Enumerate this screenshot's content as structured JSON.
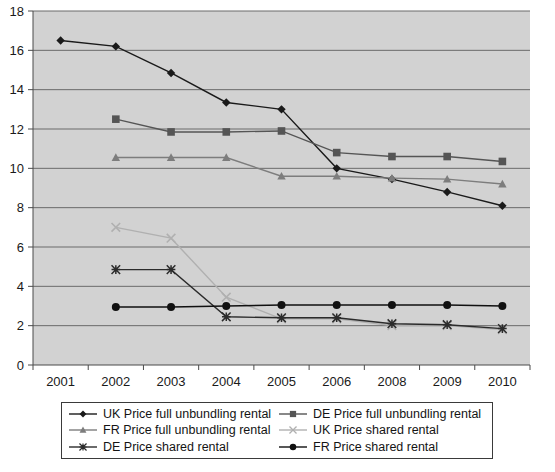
{
  "chart_data": {
    "type": "line",
    "title": "",
    "xlabel": "",
    "ylabel": "",
    "ylim": [
      0,
      18
    ],
    "ytick_step": 2,
    "grid": true,
    "legend_position": "bottom",
    "categories": [
      "2001",
      "2002",
      "2003",
      "2004",
      "2005",
      "2006",
      "2008",
      "2009",
      "2010"
    ],
    "yticks": [
      "0",
      "2",
      "4",
      "6",
      "8",
      "10",
      "12",
      "14",
      "16",
      "18"
    ],
    "series": [
      {
        "name": "UK Price full unbundling rental",
        "marker": "diamond",
        "color": "#1a1a1a",
        "values": [
          16.5,
          16.2,
          14.85,
          13.35,
          13.0,
          10.0,
          9.45,
          8.8,
          8.1
        ]
      },
      {
        "name": "DE Price full unbundling rental",
        "marker": "square",
        "color": "#555555",
        "values": [
          null,
          12.5,
          11.85,
          11.85,
          11.9,
          10.8,
          10.6,
          10.6,
          10.35
        ]
      },
      {
        "name": "FR Price full unbundling rental",
        "marker": "triangle",
        "color": "#7d7d7d",
        "values": [
          null,
          10.55,
          10.55,
          10.55,
          9.6,
          9.6,
          9.5,
          9.45,
          9.2
        ]
      },
      {
        "name": "UK Price shared rental",
        "marker": "x",
        "color": "#b0b0b0",
        "values": [
          null,
          7.0,
          6.45,
          3.45,
          2.35,
          2.35,
          2.0,
          2.0,
          1.8
        ]
      },
      {
        "name": "DE Price shared rental",
        "marker": "star",
        "color": "#2b2b2b",
        "values": [
          null,
          4.85,
          4.85,
          2.45,
          2.4,
          2.4,
          2.1,
          2.05,
          1.85
        ]
      },
      {
        "name": "FR Price shared rental",
        "marker": "circle",
        "color": "#111111",
        "values": [
          null,
          2.95,
          2.95,
          3.0,
          3.05,
          3.05,
          3.05,
          3.05,
          3.0
        ]
      }
    ]
  },
  "legend": {
    "entries": [
      {
        "label": "UK Price full unbundling rental",
        "marker": "diamond",
        "color": "#1a1a1a"
      },
      {
        "label": "DE Price full unbundling rental",
        "marker": "square",
        "color": "#555555"
      },
      {
        "label": "FR Price full unbundling rental",
        "marker": "triangle",
        "color": "#7d7d7d"
      },
      {
        "label": "UK Price shared rental",
        "marker": "x",
        "color": "#b0b0b0"
      },
      {
        "label": "DE Price shared rental",
        "marker": "star",
        "color": "#2b2b2b"
      },
      {
        "label": "FR Price shared rental",
        "marker": "circle",
        "color": "#111111"
      }
    ]
  },
  "style": {
    "plot_background": "#d2d2d2",
    "page_background": "#ffffff",
    "axis_color": "#4a4a4a",
    "grid_color": "#6a6a6a"
  }
}
